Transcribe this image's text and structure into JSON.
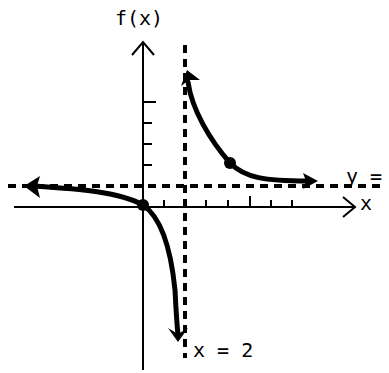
{
  "labels": {
    "y_axis": "f(x)",
    "x_axis": "x",
    "horizontal_asymptote": "y =",
    "vertical_asymptote": "x = 2"
  },
  "colors": {
    "ink": "#000000",
    "background": "#ffffff"
  },
  "graph": {
    "type": "rational function sketch",
    "vertical_asymptote_x": 2,
    "horizontal_asymptote_label": "y =",
    "x_ticks_right_of_origin": 7,
    "y_ticks_above_origin": 4,
    "marked_points": [
      {
        "name": "origin-intercept",
        "x": 0,
        "y": 0
      },
      {
        "name": "right-branch-point",
        "x": 4,
        "y": 2
      }
    ],
    "branches": [
      {
        "name": "left-branch",
        "description": "approaches horizontal asymptote to the left, passes through origin, descends toward -infinity near x = 2"
      },
      {
        "name": "right-branch",
        "description": "rises toward +infinity near x = 2, descends to approach horizontal asymptote to the right"
      }
    ]
  }
}
